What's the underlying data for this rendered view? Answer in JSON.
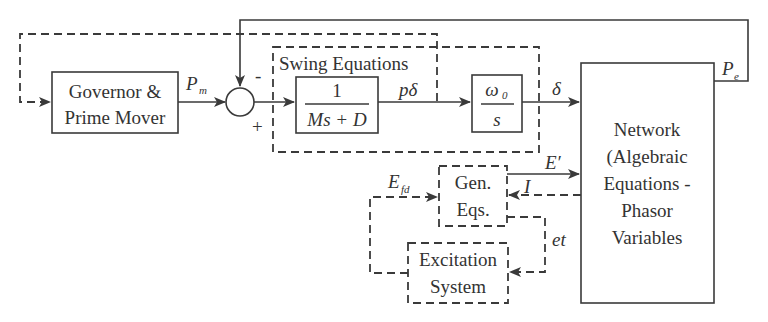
{
  "diagram": {
    "blocks": {
      "governor": {
        "line1": "Governor &",
        "line2": "Prime Mover"
      },
      "swing_group": {
        "label": "Swing Equations"
      },
      "swing_tf": {
        "numerator": "1",
        "denominator": "Ms + D"
      },
      "integrator": {
        "numerator": "ω",
        "numerator_sub": "0",
        "denominator": "s"
      },
      "network": {
        "lines": [
          "Network",
          "(Algebraic",
          "Equations -",
          "Phasor",
          "Variables"
        ]
      },
      "gen_eqs": {
        "line1": "Gen.",
        "line2": "Eqs."
      },
      "excitation": {
        "line1": "Excitation",
        "line2": "System"
      }
    },
    "signals": {
      "pm": {
        "main": "P",
        "sub": "m"
      },
      "pe": {
        "main": "P",
        "sub": "e"
      },
      "p_delta": "pδ",
      "delta": "δ",
      "e_prime": "E′",
      "current": "I",
      "efd": {
        "main": "E",
        "sub": "fd"
      },
      "et": "et"
    },
    "summing_junction": {
      "minus_sign": "-",
      "plus_sign": "+"
    },
    "colors": {
      "stroke": "#3a3a3a",
      "text": "#333333",
      "background": "#ffffff"
    }
  }
}
